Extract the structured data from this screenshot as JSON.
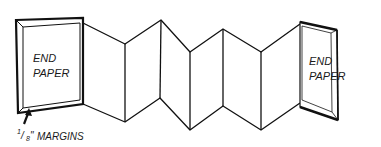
{
  "diagram": {
    "left_panel": {
      "line1": "END",
      "line2": "PAPER"
    },
    "right_panel": {
      "line1": "END",
      "line2": "PAPER"
    },
    "annotation": {
      "fraction_num": "1",
      "fraction_den": "8",
      "inch_mark": "\"",
      "text": "MARGINS"
    },
    "colors": {
      "line": "#111111",
      "paper": "#ffffff"
    }
  }
}
